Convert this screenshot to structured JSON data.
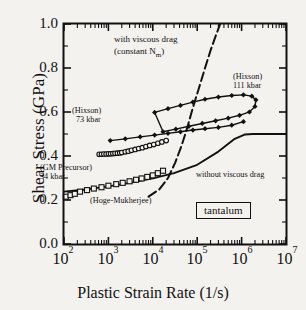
{
  "chart_data": {
    "type": "scatter",
    "title": "",
    "xlabel": "Plastic Strain Rate (1/s)",
    "ylabel": "Shear Stress (GPa)",
    "xscale": "log",
    "xlim": [
      100,
      10000000
    ],
    "ylim": [
      0.0,
      1.0
    ],
    "grid": false,
    "legend_position": "none",
    "material": "tantalum",
    "xticklabels": [
      "10",
      "10",
      "10",
      "10",
      "10",
      "10"
    ],
    "xtickexponents": [
      "2",
      "3",
      "4",
      "5",
      "6",
      "7"
    ],
    "yticklabels": [
      "0.0",
      "0.2",
      "0.4",
      "0.6",
      "0.8",
      "1.0"
    ],
    "ytickvalues": [
      0.0,
      0.2,
      0.4,
      0.6,
      0.8,
      1.0
    ],
    "series": [
      {
        "name": "Hoge-Mukherjee",
        "marker": "open-square",
        "x": [
          110,
          140,
          175,
          230,
          330,
          470,
          700,
          1000,
          1500,
          2100,
          3000,
          4200,
          5600,
          7500,
          10000,
          13000,
          17000
        ],
        "y": [
          0.215,
          0.222,
          0.228,
          0.238,
          0.245,
          0.252,
          0.258,
          0.265,
          0.272,
          0.278,
          0.285,
          0.292,
          0.298,
          0.305,
          0.312,
          0.322,
          0.333
        ]
      },
      {
        "name": "GM Precursor 34 kbar",
        "marker": "open-circle",
        "x": [
          620,
          700,
          790,
          890,
          1000,
          1120,
          1260,
          1410,
          1600,
          1800,
          2000,
          2400,
          2800,
          3300,
          4000,
          4800,
          5800,
          7000,
          8500,
          10500,
          13000,
          16000,
          20000
        ],
        "y": [
          0.408,
          0.408,
          0.409,
          0.409,
          0.41,
          0.41,
          0.411,
          0.412,
          0.413,
          0.414,
          0.416,
          0.419,
          0.422,
          0.426,
          0.43,
          0.434,
          0.438,
          0.443,
          0.448,
          0.452,
          0.458,
          0.464,
          0.47
        ]
      },
      {
        "name": "Hixson 73 kbar",
        "marker": "filled-diamond",
        "x": [
          1100,
          2400,
          5200,
          11000,
          22000,
          42000,
          80000,
          150000,
          300000,
          600000,
          1100000
        ],
        "y": [
          0.47,
          0.478,
          0.487,
          0.495,
          0.503,
          0.51,
          0.518,
          0.524,
          0.53,
          0.54,
          0.556
        ]
      },
      {
        "name": "Hixson 111 kbar",
        "marker": "filled-diamond-loop",
        "x": [
          11000,
          22000,
          42000,
          80000,
          150000,
          300000,
          600000,
          1100000,
          1700000,
          2100000,
          2000000,
          1500000,
          900000,
          500000,
          260000,
          130000,
          65000,
          33000,
          17000
        ],
        "y": [
          0.598,
          0.615,
          0.63,
          0.645,
          0.658,
          0.668,
          0.675,
          0.678,
          0.672,
          0.655,
          0.625,
          0.6,
          0.585,
          0.572,
          0.56,
          0.548,
          0.535,
          0.522,
          0.51
        ]
      }
    ],
    "curves": [
      {
        "name": "with viscous drag",
        "style": "dashed",
        "label": "with viscous drag",
        "sublabel": "(constant N",
        "sublabel_sub": "m",
        "sublabel_end": ")",
        "x": [
          8000,
          14000,
          22000,
          32000,
          45000,
          60000,
          80000,
          110000,
          150000,
          200000,
          260000,
          330000
        ],
        "y": [
          0.215,
          0.248,
          0.3,
          0.37,
          0.45,
          0.53,
          0.62,
          0.71,
          0.8,
          0.88,
          0.945,
          1.0
        ]
      },
      {
        "name": "without viscous drag",
        "style": "solid",
        "label": "without viscous drag",
        "x": [
          100,
          300,
          1000,
          3000,
          10000,
          30000,
          100000,
          300000,
          700000,
          1200000,
          1800000,
          3000000,
          10000000
        ],
        "y": [
          0.238,
          0.248,
          0.262,
          0.278,
          0.298,
          0.322,
          0.36,
          0.42,
          0.478,
          0.498,
          0.5,
          0.5,
          0.5
        ]
      }
    ],
    "annotations": [
      {
        "id": "with-viscous-drag",
        "text": "with viscous drag"
      },
      {
        "id": "constant-nm",
        "text": "(constant N",
        "sub": "m",
        "tail": ")"
      },
      {
        "id": "hixson-111-name",
        "text": "(Hixson)"
      },
      {
        "id": "hixson-111-value",
        "text": "111 kbar"
      },
      {
        "id": "hixson-73-name",
        "text": "(Hixson)"
      },
      {
        "id": "hixson-73-value",
        "text": "73 kbar"
      },
      {
        "id": "gm-precursor-name",
        "text": "(GM Precursor)"
      },
      {
        "id": "gm-precursor-value",
        "text": "34 kbar"
      },
      {
        "id": "hoge-mukherjee",
        "text": "(Hoge-Mukherjee)"
      },
      {
        "id": "without-viscous-drag",
        "text": "without viscous drag"
      },
      {
        "id": "tantalum-box",
        "text": "tantalum"
      }
    ],
    "colors": {
      "axis": "#111111",
      "data": "#111111",
      "background": "#f4f2ef"
    }
  }
}
